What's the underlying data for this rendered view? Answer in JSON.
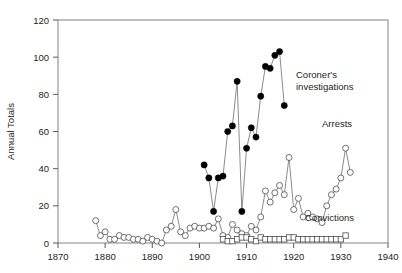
{
  "chart_data": {
    "type": "line",
    "title": "",
    "xlabel": "",
    "ylabel": "Annual Totals",
    "xlim": [
      1870,
      1940
    ],
    "ylim": [
      0,
      120
    ],
    "grid": false,
    "legend_position": "inline-annotations",
    "xticks": [
      1870,
      1880,
      1890,
      1900,
      1910,
      1920,
      1930,
      1940
    ],
    "xtick_labels": [
      "1870",
      "1880",
      "1890",
      "1900",
      "1910",
      "1920",
      "1930",
      "1940"
    ],
    "yticks": [
      0,
      20,
      40,
      60,
      80,
      100,
      120
    ],
    "ytick_labels": [
      "0",
      "20",
      "40",
      "60",
      "80",
      "100",
      "120"
    ],
    "series": [
      {
        "name": "Coroner's investigations",
        "marker": "filled-circle",
        "x": [
          1901,
          1902,
          1903,
          1904,
          1905,
          1906,
          1907,
          1908,
          1909,
          1910,
          1911,
          1912,
          1913,
          1914,
          1915,
          1916,
          1917,
          1918
        ],
        "values": [
          42,
          35,
          17,
          35,
          36,
          60,
          63,
          87,
          17,
          51,
          62,
          57,
          79,
          95,
          94,
          101,
          103,
          74
        ]
      },
      {
        "name": "Arrests",
        "marker": "open-circle",
        "x": [
          1878,
          1879,
          1880,
          1881,
          1882,
          1883,
          1884,
          1885,
          1886,
          1887,
          1888,
          1889,
          1890,
          1891,
          1892,
          1893,
          1894,
          1895,
          1896,
          1897,
          1898,
          1899,
          1900,
          1901,
          1902,
          1903,
          1904,
          1905,
          1906,
          1907,
          1908,
          1909,
          1910,
          1911,
          1912,
          1913,
          1914,
          1915,
          1916,
          1917,
          1918,
          1919,
          1920,
          1921,
          1922,
          1923,
          1924,
          1925,
          1926,
          1927,
          1928,
          1929,
          1930,
          1931,
          1932
        ],
        "values": [
          12,
          4,
          6,
          2,
          2,
          4,
          3,
          3,
          2,
          2,
          1,
          3,
          2,
          1,
          0,
          7,
          9,
          18,
          6,
          4,
          8,
          9,
          8,
          8,
          9,
          8,
          13,
          4,
          3,
          10,
          7,
          5,
          4,
          9,
          7,
          14,
          28,
          22,
          27,
          31,
          26,
          46,
          18,
          24,
          14,
          16,
          14,
          13,
          11,
          20,
          26,
          29,
          35,
          51,
          38
        ]
      },
      {
        "name": "Convictions",
        "marker": "open-square",
        "x": [
          1905,
          1906,
          1907,
          1908,
          1909,
          1910,
          1911,
          1912,
          1913,
          1914,
          1915,
          1916,
          1917,
          1918,
          1919,
          1920,
          1921,
          1922,
          1923,
          1924,
          1925,
          1926,
          1927,
          1928,
          1929,
          1930,
          1931
        ],
        "values": [
          2,
          1,
          1,
          2,
          3,
          3,
          2,
          1,
          3,
          2,
          2,
          2,
          2,
          2,
          3,
          3,
          2,
          2,
          2,
          2,
          2,
          2,
          2,
          2,
          2,
          2,
          4
        ]
      }
    ],
    "annotations": [
      {
        "text": "Coroner's",
        "series": "Coroner's investigations"
      },
      {
        "text": "investigations",
        "series": "Coroner's investigations"
      },
      {
        "text": "Arrests",
        "series": "Arrests"
      },
      {
        "text": "Convictions",
        "series": "Convictions"
      }
    ]
  }
}
